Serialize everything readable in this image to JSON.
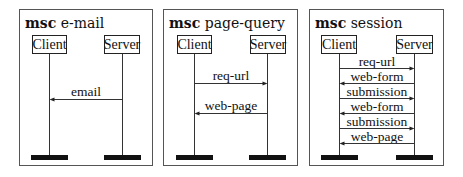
{
  "diagrams": [
    {
      "keyword": "msc",
      "name": "e-mail",
      "instances": [
        "Client",
        "Server"
      ],
      "messages": [
        {
          "label": "email",
          "from": "Server",
          "to": "Client"
        }
      ]
    },
    {
      "keyword": "msc",
      "name": "page-query",
      "instances": [
        "Client",
        "Server"
      ],
      "messages": [
        {
          "label": "req-url",
          "from": "Client",
          "to": "Server"
        },
        {
          "label": "web-page",
          "from": "Server",
          "to": "Client"
        }
      ]
    },
    {
      "keyword": "msc",
      "name": "session",
      "instances": [
        "Client",
        "Server"
      ],
      "messages": [
        {
          "label": "req-url",
          "from": "Client",
          "to": "Server"
        },
        {
          "label": "web-form",
          "from": "Server",
          "to": "Client"
        },
        {
          "label": "submission",
          "from": "Client",
          "to": "Server"
        },
        {
          "label": "web-form",
          "from": "Server",
          "to": "Client"
        },
        {
          "label": "submission",
          "from": "Client",
          "to": "Server"
        },
        {
          "label": "web-page",
          "from": "Server",
          "to": "Client"
        }
      ]
    }
  ]
}
